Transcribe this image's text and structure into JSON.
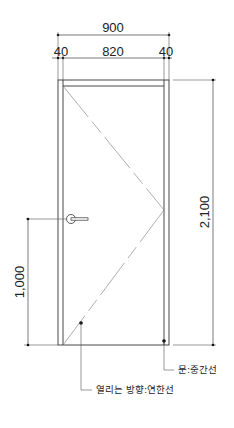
{
  "diagram": {
    "type": "door-elevation",
    "dimensions": {
      "overall_width": "900",
      "left_jamb": "40",
      "clear_width": "820",
      "right_jamb": "40",
      "height": "2,100",
      "handle_height": "1,000"
    },
    "labels": {
      "door_line": "문:중간선",
      "opening_direction": "열리는 방향:연한선"
    },
    "colors": {
      "line": "#333333",
      "light_line": "#777777",
      "background": "#ffffff"
    }
  }
}
